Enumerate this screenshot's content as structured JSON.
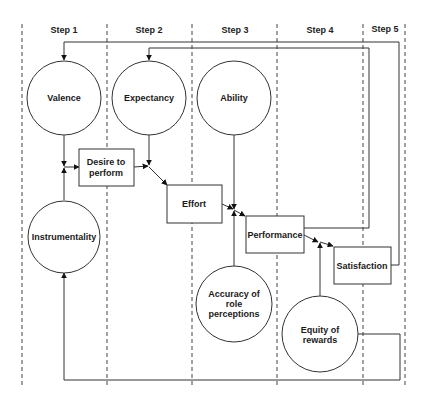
{
  "diagram": {
    "steps": [
      {
        "label": "Step 1"
      },
      {
        "label": "Step 2"
      },
      {
        "label": "Step 3"
      },
      {
        "label": "Step 4"
      },
      {
        "label": "Step 5"
      }
    ],
    "circles": {
      "valence": {
        "lines": [
          "Valence"
        ]
      },
      "expectancy": {
        "lines": [
          "Expectancy"
        ]
      },
      "ability": {
        "lines": [
          "Ability"
        ]
      },
      "instrumentality": {
        "lines": [
          "Instrumentality"
        ]
      },
      "accuracy": {
        "lines": [
          "Accuracy of",
          "role",
          "perceptions"
        ]
      },
      "equity": {
        "lines": [
          "Equity of",
          "rewards"
        ]
      }
    },
    "boxes": {
      "desire": {
        "lines": [
          "Desire to",
          "perform"
        ]
      },
      "effort": {
        "lines": [
          "Effort"
        ]
      },
      "performance": {
        "lines": [
          "Performance"
        ]
      },
      "satisfaction": {
        "lines": [
          "Satisfaction"
        ]
      }
    },
    "edges": [
      {
        "from": "Valence",
        "to": "Desire to perform"
      },
      {
        "from": "Instrumentality",
        "to": "Desire to perform"
      },
      {
        "from": "Desire to perform",
        "to": "Effort"
      },
      {
        "from": "Expectancy",
        "to": "Effort"
      },
      {
        "from": "Effort",
        "to": "Performance"
      },
      {
        "from": "Ability",
        "to": "Performance"
      },
      {
        "from": "Accuracy of role perceptions",
        "to": "Performance"
      },
      {
        "from": "Performance",
        "to": "Satisfaction"
      },
      {
        "from": "Equity of rewards",
        "to": "Satisfaction"
      },
      {
        "from": "Satisfaction",
        "to": "Valence"
      },
      {
        "from": "Performance",
        "to": "Expectancy"
      },
      {
        "from": "Equity of rewards",
        "to": "Instrumentality"
      }
    ]
  }
}
